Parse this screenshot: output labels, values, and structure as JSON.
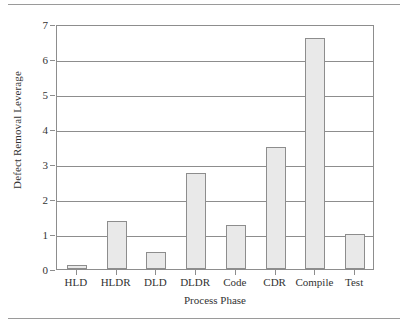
{
  "chart_data": {
    "type": "bar",
    "title": "",
    "xlabel": "Process Phase",
    "ylabel": "Defect Removal Leverage",
    "categories": [
      "HLD",
      "HLDR",
      "DLD",
      "DLDR",
      "Code",
      "CDR",
      "Compile",
      "Test"
    ],
    "values": [
      0.12,
      1.38,
      0.48,
      2.74,
      1.25,
      3.5,
      6.6,
      1.0
    ],
    "ylim": [
      0,
      7
    ],
    "yticks": [
      0,
      1,
      2,
      3,
      4,
      5,
      6,
      7
    ],
    "ytick_labels": [
      "0",
      "1",
      "2",
      "3",
      "4",
      "5",
      "6",
      "7"
    ],
    "grid": true,
    "grid_axis": "y",
    "legend": false,
    "bar_fill_color": "#e9e9e9",
    "bar_edge_color": "#8d8d8d",
    "axis_color": "#8d8d8d",
    "text_color": "#333333",
    "background_color": "#ffffff"
  },
  "figure": {
    "top_rule": "",
    "bottom_rule": ""
  }
}
